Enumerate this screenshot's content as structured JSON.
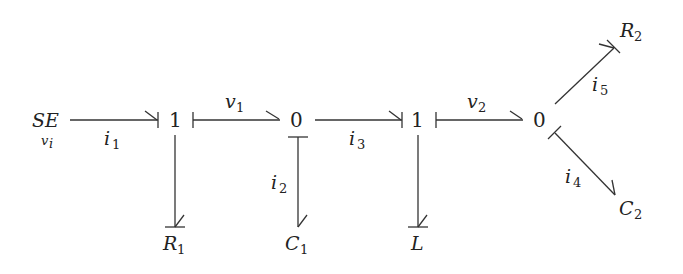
{
  "diagram": {
    "type": "bond graph",
    "nodes": {
      "source": {
        "label": "SE",
        "sub": "v",
        "sub_sub": "i"
      },
      "junction1a": {
        "label": "1"
      },
      "junction0a": {
        "label": "0"
      },
      "junction1b": {
        "label": "1"
      },
      "junction0b": {
        "label": "0"
      },
      "R1": {
        "label": "R",
        "sub": "1"
      },
      "C1": {
        "label": "C",
        "sub": "1"
      },
      "L": {
        "label": "L"
      },
      "R2": {
        "label": "R",
        "sub": "2"
      },
      "C2": {
        "label": "C",
        "sub": "2"
      }
    },
    "bonds": [
      {
        "from": "SE",
        "to": "1",
        "label": "i",
        "sub": "1"
      },
      {
        "from": "1",
        "to": "0",
        "label": "v",
        "sub": "1"
      },
      {
        "from": "0",
        "to": "C1",
        "label": "i",
        "sub": "2"
      },
      {
        "from": "0",
        "to": "1",
        "label": "i",
        "sub": "3"
      },
      {
        "from": "1",
        "to": "0",
        "label": "v",
        "sub": "2"
      },
      {
        "from": "0",
        "to": "C2",
        "label": "i",
        "sub": "4"
      },
      {
        "from": "0",
        "to": "R2",
        "label": "i",
        "sub": "5"
      },
      {
        "from": "1",
        "to": "R1"
      },
      {
        "from": "1",
        "to": "L"
      }
    ]
  }
}
